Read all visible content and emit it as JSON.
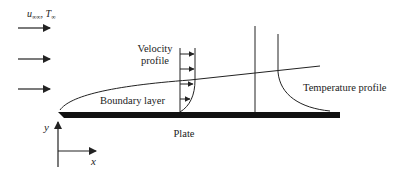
{
  "diagram": {
    "freestream_label": "u∞∞, T∞",
    "freestream_u": "u",
    "freestream_u_sub": "∞∞",
    "freestream_sep": ", ",
    "freestream_T": "T",
    "freestream_T_sub": "∞",
    "velocity_label_line1": "Velocity",
    "velocity_label_line2": "profile",
    "boundary_layer_label": "Boundary layer",
    "temperature_label": "Temperature profile",
    "plate_label": "Plate",
    "y_axis_label": "y",
    "x_axis_label": "x",
    "colors": {
      "stroke": "#222222",
      "plate": "#111111",
      "background": "#ffffff"
    }
  }
}
